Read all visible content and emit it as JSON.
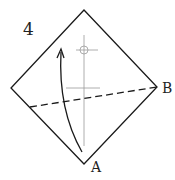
{
  "diagram": {
    "step_number": "4",
    "point_labels": {
      "a": "A",
      "b": "B"
    },
    "elements": {
      "square_outline": "diamond (square rotated 45°)",
      "valley_fold_line": "dashed line from lower-left edge to corner B",
      "center_crease": "vertical crease with reference marks",
      "fold_arrow": "curved arrow from corner A upward"
    },
    "colors": {
      "line": "#1a1a1a",
      "crease": "#888888"
    }
  }
}
